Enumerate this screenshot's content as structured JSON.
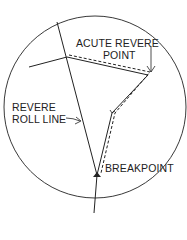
{
  "diagram": {
    "type": "eyelid/surgical line diagram",
    "colors": {
      "ink": "#222222",
      "background": "#ffffff"
    },
    "labels": {
      "acute_revere_line1": "ACUTE REVERE",
      "acute_revere_line2": "POINT",
      "revere_roll_line1": "REVERE",
      "revere_roll_line2": "ROLL LINE",
      "breakpoint": "BREAKPOINT"
    },
    "elements": [
      {
        "name": "outer-circle",
        "shape": "circle"
      },
      {
        "name": "revere-roll-line",
        "shape": "solid line"
      },
      {
        "name": "fold-path-solid",
        "shape": "solid polyline"
      },
      {
        "name": "fold-path-dashed",
        "shape": "dashed polyline"
      },
      {
        "name": "acute-revere-point-arrow",
        "shape": "arrow"
      },
      {
        "name": "revere-roll-line-arrow",
        "shape": "arrow"
      },
      {
        "name": "breakpoint-marker",
        "shape": "triangle marker"
      }
    ]
  }
}
